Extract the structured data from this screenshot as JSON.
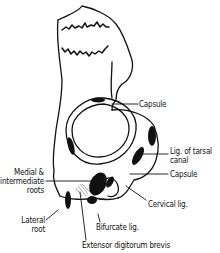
{
  "figure": {
    "labels": {
      "capsule_top": "Capsule",
      "lig_tarsal_canal_1": "Lig. of tarsal",
      "lig_tarsal_canal_2": "canal",
      "capsule_right": "Capsule",
      "medial_1": "Medial &",
      "medial_2": "intermediate",
      "medial_3": "roots",
      "cervical": "Cervical lig.",
      "lateral_1": "Lateral",
      "lateral_2": "root",
      "bifurcate": "Bifurcate lig.",
      "extensor": "Extensor digitorum brevis"
    }
  }
}
